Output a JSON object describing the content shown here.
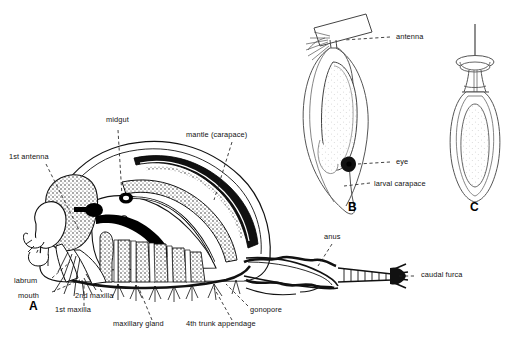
{
  "figure": {
    "background": "#ffffff",
    "ink": "#1a1a1a",
    "width": 510,
    "height": 348
  },
  "panels": [
    {
      "letter": "A",
      "name": "adult-lateral-section",
      "x": 33,
      "y": 310,
      "description": "Adult crustacean lateral dissection showing internal anatomy"
    },
    {
      "letter": "B",
      "name": "nauplius-larva",
      "x": 352,
      "y": 212,
      "description": "Larva attached by antenna showing larval carapace"
    },
    {
      "letter": "C",
      "name": "cypris-larva",
      "x": 474,
      "y": 212,
      "description": "Attached larva on cement disc"
    }
  ],
  "labels": [
    {
      "id": "first-antenna",
      "text": "1st antenna",
      "x": 9,
      "y": 158,
      "anchor": "start"
    },
    {
      "id": "midgut",
      "text": "midgut",
      "x": 106,
      "y": 121,
      "anchor": "start"
    },
    {
      "id": "mantle-carapace",
      "text": "mantle (carapace)",
      "x": 186,
      "y": 136,
      "anchor": "start"
    },
    {
      "id": "labrum",
      "text": "labrum",
      "x": 14,
      "y": 281,
      "anchor": "start"
    },
    {
      "id": "mouth",
      "text": "mouth",
      "x": 18,
      "y": 296,
      "anchor": "start"
    },
    {
      "id": "first-maxilla",
      "text": "1st maxilla",
      "x": 55,
      "y": 310,
      "anchor": "start"
    },
    {
      "id": "second-maxilla",
      "text": "2nd maxilla",
      "x": 75,
      "y": 296,
      "anchor": "start"
    },
    {
      "id": "maxillary-gland",
      "text": "maxillary gland",
      "x": 113,
      "y": 324,
      "anchor": "start"
    },
    {
      "id": "fourth-trunk-appendage",
      "text": "4th trunk appendage",
      "x": 186,
      "y": 324,
      "anchor": "start"
    },
    {
      "id": "gonopore",
      "text": "gonopore",
      "x": 250,
      "y": 310,
      "anchor": "start"
    },
    {
      "id": "anus",
      "text": "anus",
      "x": 324,
      "y": 238,
      "anchor": "start"
    },
    {
      "id": "caudal-furca",
      "text": "caudal furca",
      "x": 421,
      "y": 272,
      "anchor": "start"
    },
    {
      "id": "antenna",
      "text": "antenna",
      "x": 396,
      "y": 41,
      "anchor": "start"
    },
    {
      "id": "eye",
      "text": "eye",
      "x": 396,
      "y": 159,
      "anchor": "start"
    },
    {
      "id": "larval-carapace",
      "text": "larval carapace",
      "x": 374,
      "y": 186,
      "anchor": "start"
    }
  ]
}
